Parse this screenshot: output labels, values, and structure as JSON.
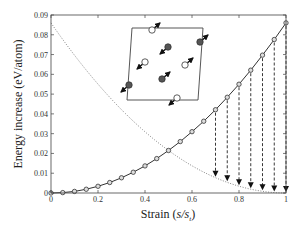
{
  "chart_data": {
    "type": "line",
    "title": "",
    "xlabel": "Strain (s/s_t)",
    "xlabel_parts": {
      "prefix": "Strain (",
      "var": "s/s",
      "sub": "t",
      "suffix": ")"
    },
    "ylabel": "Energy increase (eV/atom)",
    "xlim": [
      0,
      1
    ],
    "ylim": [
      0,
      0.09
    ],
    "x_ticks": [
      "0",
      "0.2",
      "0.4",
      "0.6",
      "0.8",
      "1"
    ],
    "x_tick_values": [
      0,
      0.2,
      0.4,
      0.6,
      0.8,
      1
    ],
    "y_ticks": [
      "0",
      "0.01",
      "0.02",
      "0.03",
      "0.04",
      "0.05",
      "0.06",
      "0.07",
      "0.08",
      "0.09"
    ],
    "y_tick_values": [
      0,
      0.01,
      0.02,
      0.03,
      0.04,
      0.05,
      0.06,
      0.07,
      0.08,
      0.09
    ],
    "grid": false,
    "legend": null,
    "series": [
      {
        "name": "forward transformation path",
        "style": "solid line with open circle markers",
        "x": [
          0,
          0.05,
          0.1,
          0.15,
          0.2,
          0.25,
          0.3,
          0.35,
          0.4,
          0.45,
          0.5,
          0.55,
          0.6,
          0.65,
          0.7,
          0.75,
          0.8,
          0.85,
          0.9,
          0.95,
          1.0
        ],
        "values": [
          0,
          0.0002,
          0.0008,
          0.0019,
          0.0034,
          0.0053,
          0.0077,
          0.0105,
          0.0137,
          0.0174,
          0.0215,
          0.026,
          0.031,
          0.0363,
          0.0421,
          0.0484,
          0.055,
          0.0621,
          0.0697,
          0.0776,
          0.086
        ]
      },
      {
        "name": "reverse path",
        "style": "dotted line",
        "x": [
          0,
          0.1,
          0.2,
          0.3,
          0.4,
          0.5,
          0.6,
          0.7,
          0.8,
          0.9,
          1.0
        ],
        "values": [
          0.086,
          0.0697,
          0.055,
          0.0421,
          0.031,
          0.0215,
          0.0137,
          0.0077,
          0.0034,
          0.0008,
          0
        ]
      }
    ],
    "annotations": {
      "drop_arrows": {
        "style": "dashed vertical arrows from solid curve down to dotted curve",
        "x": [
          0.7,
          0.75,
          0.8,
          0.85,
          0.9,
          0.95,
          1.0
        ]
      },
      "inset": "atomic cell (parallelogram) with filled and open atoms, arrows indicating displacement directions"
    }
  }
}
